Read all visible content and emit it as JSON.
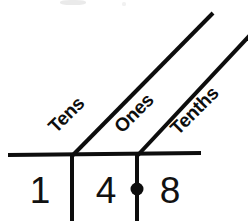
{
  "diagram": {
    "kind": "place-value-chart",
    "number_shown": "14.8",
    "ink_color": "#0d0d0d",
    "background_color": "#ffffff",
    "baseline_label": "horizontal-place-value-line",
    "place_labels": [
      {
        "id": "tens",
        "text": "Tens",
        "x": 56,
        "y": 134,
        "rotate": -45
      },
      {
        "id": "ones",
        "text": "Ones",
        "x": 122,
        "y": 134,
        "rotate": -45
      },
      {
        "id": "tenths",
        "text": "Tenths",
        "x": 178,
        "y": 136,
        "rotate": -45
      }
    ],
    "digits": [
      {
        "id": "tens-digit",
        "value": "1",
        "x": 40,
        "y": 203
      },
      {
        "id": "ones-digit",
        "value": "4",
        "x": 106,
        "y": 203
      },
      {
        "id": "tenths-digit",
        "value": "8",
        "x": 170,
        "y": 203
      }
    ],
    "decimal_point": {
      "id": "decimal-point",
      "cx": 137,
      "cy": 189,
      "r": 6
    },
    "geometry": {
      "baseline": {
        "x1": 8,
        "y1": 155,
        "x2": 201,
        "y2": 153,
        "width": 4
      },
      "verticals": [
        {
          "id": "tens-ones-divider",
          "x1": 72,
          "y1": 153,
          "x2": 72,
          "y2": 221,
          "width": 4
        },
        {
          "id": "ones-tenths-divider",
          "x1": 137,
          "y1": 153,
          "x2": 137,
          "y2": 221,
          "width": 4
        }
      ],
      "diagonals": [
        {
          "id": "tens-leader-line",
          "x1": 72,
          "y1": 155,
          "x2": 213,
          "y2": 13,
          "width": 4
        },
        {
          "id": "tenths-leader-line",
          "x1": 137,
          "y1": 155,
          "x2": 250,
          "y2": 35,
          "width": 4
        }
      ]
    }
  }
}
